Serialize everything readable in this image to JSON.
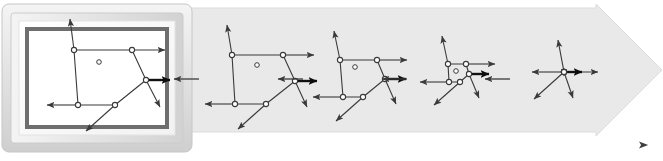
{
  "figure": {
    "width": 663,
    "height": 161,
    "background_color": "#ffffff",
    "band_color": "#e9e9e9",
    "band_edge_color": "#dcdcdc",
    "stroke_color": "#3a3a3a",
    "bold_stroke_color": "#111111",
    "vertex_fill": "#ffffff",
    "frame": {
      "outer_bevel_color": "#d4d4d4",
      "outer_bevel_light": "#f0f0f0",
      "mat_color": "#fbfbfb",
      "inner_border_color": "#6e6e6e",
      "canvas_color": "#ffffff",
      "label": "framed-initial-state"
    },
    "progress_arrow": {
      "label": "iteration-progress-arrow",
      "start_color": "#f2f2f2",
      "end_color": "#4a4a4a",
      "y": 145,
      "x_start": 228,
      "x_end": 648
    }
  },
  "chart_data": {
    "type": "diagram-sequence",
    "stage_count": 5,
    "centroid_marker": "small open circle",
    "vector_count_per_stage": 5,
    "bold_vector_index": 3,
    "stages": [
      {
        "index": 1,
        "label": "stage-1-framed",
        "framed": true,
        "origin_x": 42,
        "origin_y": 17,
        "scale": 1.0,
        "centroid": [
          57,
          45
        ],
        "vertices": [
          {
            "id": "v1",
            "x": 32,
            "y": 33,
            "vx": -4,
            "vy": -31
          },
          {
            "id": "v2",
            "x": 90,
            "y": 33,
            "vx": 33,
            "vy": 0
          },
          {
            "id": "v3",
            "x": 104,
            "y": 63,
            "vx": 24,
            "vy": 0,
            "bold": true
          },
          {
            "id": "v4",
            "x": 73,
            "y": 88,
            "vx": -29,
            "vy": 26
          },
          {
            "id": "v5",
            "x": 36,
            "y": 88,
            "vx": -31,
            "vy": 0
          },
          {
            "id": "v3b",
            "x": 104,
            "y": 63,
            "vx": 14,
            "vy": 27,
            "extra": true
          }
        ]
      },
      {
        "index": 2,
        "label": "stage-2",
        "framed": false,
        "origin_x": 205,
        "origin_y": 17,
        "scale": 0.92,
        "centroid": [
          52,
          48
        ],
        "vertices": [
          {
            "id": "v1",
            "x": 27,
            "y": 38,
            "vx": -5,
            "vy": -30
          },
          {
            "id": "v2",
            "x": 78,
            "y": 38,
            "vx": 31,
            "vy": 0
          },
          {
            "id": "v3",
            "x": 90,
            "y": 64,
            "vx": 22,
            "vy": 0,
            "bold": true
          },
          {
            "id": "v4",
            "x": 61,
            "y": 87,
            "vx": -28,
            "vy": 25
          },
          {
            "id": "v5",
            "x": 30,
            "y": 87,
            "vx": -30,
            "vy": 0
          },
          {
            "id": "v3b",
            "x": 90,
            "y": 64,
            "vx": 12,
            "vy": 26,
            "extra": true
          }
        ]
      },
      {
        "index": 3,
        "label": "stage-3",
        "framed": false,
        "origin_x": 305,
        "origin_y": 17,
        "scale": 0.84,
        "centroid": [
          50,
          50
        ],
        "vertices": [
          {
            "id": "v1",
            "x": 35,
            "y": 43,
            "vx": -6,
            "vy": -29
          },
          {
            "id": "v2",
            "x": 72,
            "y": 43,
            "vx": 30,
            "vy": 0
          },
          {
            "id": "v3",
            "x": 80,
            "y": 62,
            "vx": 21,
            "vy": 0,
            "bold": true
          },
          {
            "id": "v4",
            "x": 58,
            "y": 80,
            "vx": -27,
            "vy": 24
          },
          {
            "id": "v5",
            "x": 38,
            "y": 80,
            "vx": -30,
            "vy": 0
          },
          {
            "id": "v3b",
            "x": 80,
            "y": 62,
            "vx": 11,
            "vy": 25,
            "extra": true
          }
        ]
      },
      {
        "index": 4,
        "label": "stage-4",
        "framed": false,
        "origin_x": 408,
        "origin_y": 17,
        "scale": 0.72,
        "centroid": [
          48,
          54
        ],
        "vertices": [
          {
            "id": "v1",
            "x": 40,
            "y": 47,
            "vx": -6,
            "vy": -28
          },
          {
            "id": "v2",
            "x": 58,
            "y": 47,
            "vx": 29,
            "vy": 0
          },
          {
            "id": "v3",
            "x": 61,
            "y": 57,
            "vx": 20,
            "vy": 0,
            "bold": true
          },
          {
            "id": "v4",
            "x": 52,
            "y": 65,
            "vx": -26,
            "vy": 23
          },
          {
            "id": "v5",
            "x": 41,
            "y": 65,
            "vx": -29,
            "vy": 0
          },
          {
            "id": "v3b",
            "x": 61,
            "y": 57,
            "vx": 10,
            "vy": 24,
            "extra": true
          }
        ]
      },
      {
        "index": 5,
        "label": "stage-5-collapsed",
        "framed": false,
        "origin_x": 512,
        "origin_y": 17,
        "scale": 0.6,
        "centroid": [
          52,
          55
        ],
        "collapsed": true,
        "vertices": [
          {
            "id": "v1",
            "x": 52,
            "y": 55,
            "vx": -6,
            "vy": -32
          },
          {
            "id": "v2",
            "x": 52,
            "y": 55,
            "vx": 34,
            "vy": 0
          },
          {
            "id": "v3",
            "x": 52,
            "y": 55,
            "vx": 18,
            "vy": 0,
            "bold": true
          },
          {
            "id": "v4",
            "x": 52,
            "y": 55,
            "vx": -30,
            "vy": 27
          },
          {
            "id": "v5",
            "x": 52,
            "y": 55,
            "vx": -32,
            "vy": 0
          },
          {
            "id": "v3b",
            "x": 52,
            "y": 55,
            "vx": 9,
            "vy": 26,
            "extra": true
          }
        ]
      }
    ],
    "transition_arrows": [
      {
        "label": "transition-1-to-2",
        "x1": 199,
        "y1": 79,
        "x2": 174,
        "y2": 79,
        "direction": "left"
      },
      {
        "label": "transition-2-to-3",
        "x1": 303,
        "y1": 79,
        "x2": 278,
        "y2": 79,
        "direction": "left"
      },
      {
        "label": "transition-3-to-4",
        "x1": 407,
        "y1": 79,
        "x2": 382,
        "y2": 79,
        "direction": "left"
      },
      {
        "label": "transition-4-to-5",
        "x1": 510,
        "y1": 79,
        "x2": 485,
        "y2": 79,
        "direction": "left"
      }
    ]
  }
}
